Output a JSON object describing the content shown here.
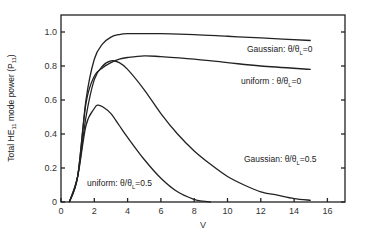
{
  "chart_data": {
    "type": "line",
    "title": "",
    "xlabel": "V",
    "ylabel": "Total HE11 mode power (P11)",
    "ylabel_parts": {
      "pre": "Total  HE",
      "sub": "11",
      "mid": "  mode power  (P",
      "sub2": "11",
      "post": ")"
    },
    "xlim": [
      0,
      17
    ],
    "ylim": [
      0,
      1.1
    ],
    "xticks": [
      0,
      2,
      4,
      6,
      8,
      10,
      12,
      14,
      16
    ],
    "yticks": [
      0,
      0.2,
      0.4,
      0.6,
      0.8,
      1.0
    ],
    "ytick_labels": [
      "0",
      "0.2",
      "0.4",
      "0.6",
      "0.8",
      "1.0"
    ],
    "grid": false,
    "legend": "inline annotations",
    "series": [
      {
        "name": "Gaussian: θ/θL=0",
        "label_pre": "Gaussian: θ/θ",
        "label_sub": "L",
        "label_post": "=0",
        "x": [
          0.5,
          1.0,
          1.5,
          2.0,
          2.5,
          3.0,
          3.5,
          4.0,
          5.0,
          6.0,
          8.0,
          10.0,
          12.0,
          15.0
        ],
        "values": [
          0.0,
          0.15,
          0.6,
          0.84,
          0.93,
          0.97,
          0.985,
          0.99,
          0.99,
          0.99,
          0.985,
          0.975,
          0.965,
          0.95
        ]
      },
      {
        "name": "uniform: θ/θL=0",
        "label_pre": "uniform : θ/θ",
        "label_sub": "L",
        "label_post": "=0",
        "x": [
          0.5,
          1.0,
          1.5,
          2.0,
          2.5,
          3.0,
          3.5,
          4.0,
          5.0,
          6.0,
          8.0,
          10.0,
          12.0,
          15.0
        ],
        "values": [
          0.0,
          0.15,
          0.58,
          0.74,
          0.79,
          0.82,
          0.84,
          0.85,
          0.86,
          0.855,
          0.84,
          0.82,
          0.8,
          0.78
        ]
      },
      {
        "name": "Gaussian: θ/θL=0.5",
        "label_pre": "Gaussian: θ/θ",
        "label_sub": "L",
        "label_post": "=0.5",
        "x": [
          0.5,
          1.0,
          1.5,
          2.0,
          2.5,
          3.0,
          3.5,
          4.0,
          5.0,
          6.0,
          7.0,
          8.0,
          9.0,
          10.0,
          11.0,
          12.0,
          13.0,
          14.0,
          15.0
        ],
        "values": [
          0.0,
          0.15,
          0.5,
          0.72,
          0.8,
          0.83,
          0.82,
          0.78,
          0.66,
          0.52,
          0.4,
          0.3,
          0.22,
          0.15,
          0.1,
          0.06,
          0.04,
          0.02,
          0.01
        ]
      },
      {
        "name": "uniform: θ/θL=0.5",
        "label_pre": "uniform: θ/θ",
        "label_sub": "L",
        "label_post": "=0.5",
        "x": [
          0.5,
          1.0,
          1.5,
          2.0,
          2.2,
          2.5,
          3.0,
          3.5,
          4.0,
          5.0,
          6.0,
          7.0,
          8.0,
          8.5,
          9.0
        ],
        "values": [
          0.0,
          0.15,
          0.45,
          0.55,
          0.57,
          0.56,
          0.52,
          0.45,
          0.38,
          0.25,
          0.14,
          0.06,
          0.015,
          0.005,
          0.0
        ]
      }
    ]
  }
}
